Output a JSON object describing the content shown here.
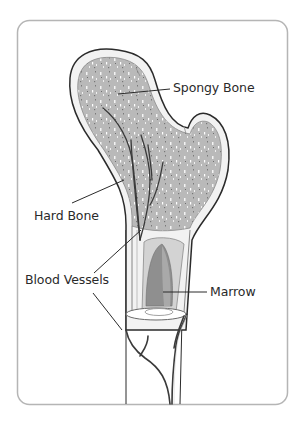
{
  "diagram": {
    "labels": [
      {
        "id": "spongy-bone",
        "text": "Spongy Bone"
      },
      {
        "id": "hard-bone",
        "text": "Hard Bone"
      },
      {
        "id": "blood-vessels",
        "text": "Blood Vessels"
      },
      {
        "id": "marrow",
        "text": "Marrow"
      }
    ],
    "colors": {
      "frame": "#b5b5b5",
      "outline": "#2b2b2b",
      "hard_bone": "#f1f1f1",
      "spongy_bone": "#b8b8b8",
      "marrow_outer": "#d2d2d2",
      "marrow_inner": "#8e8e8e",
      "vessel": "#3a3a3a"
    }
  }
}
